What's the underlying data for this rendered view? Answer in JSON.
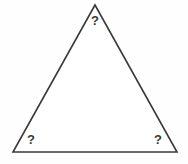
{
  "diagram": {
    "shape_name": "triangle",
    "stroke_color": "#3a3a3a",
    "fill_color": "#ffffff",
    "background_color": "#fefefe",
    "stroke_width": 1.6,
    "vertices": [
      {
        "name": "apex",
        "x": 95,
        "y": 5
      },
      {
        "name": "bottom-left",
        "x": 13,
        "y": 152
      },
      {
        "name": "bottom-right",
        "x": 177,
        "y": 152
      }
    ],
    "angle_labels": [
      {
        "id": "apex",
        "text": "?"
      },
      {
        "id": "bottom-left",
        "text": "?"
      },
      {
        "id": "bottom-right",
        "text": "?"
      }
    ]
  }
}
